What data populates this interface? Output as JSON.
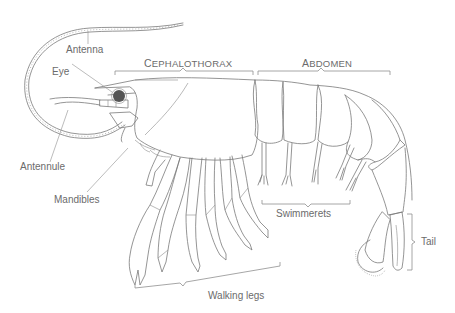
{
  "diagram": {
    "regions": [
      {
        "id": "cephalothorax",
        "label_first": "C",
        "label_rest": "EPHALOTHORAX"
      },
      {
        "id": "abdomen",
        "label_first": "A",
        "label_rest": "BDOMEN"
      }
    ],
    "labels": {
      "antenna": "Antenna",
      "eye": "Eye",
      "antennule": "Antennule",
      "mandibles": "Mandibles",
      "swimmerets": "Swimmerets",
      "walking_legs": "Walking legs",
      "tail": "Tail"
    },
    "colors": {
      "line": "#7a7a7a",
      "label": "#6b6b6b",
      "eye": "#555555",
      "background": "#ffffff"
    }
  }
}
